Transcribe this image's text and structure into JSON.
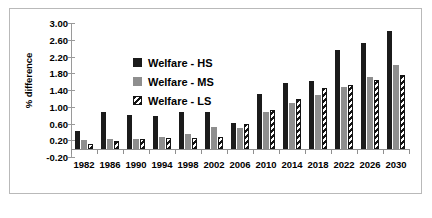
{
  "chart_data": {
    "type": "bar",
    "title": "",
    "subtitle": "",
    "xlabel": "",
    "ylabel": "% difference",
    "ylim": [
      -0.2,
      3.0
    ],
    "ytick_step": 0.4,
    "yticks": [
      "3.00",
      "2.60",
      "2.20",
      "1.80",
      "1.40",
      "1.00",
      "0.60",
      "0.20",
      "-0.20"
    ],
    "ytick_values": [
      3.0,
      2.6,
      2.2,
      1.8,
      1.4,
      1.0,
      0.6,
      0.2,
      -0.2
    ],
    "grid": false,
    "legend_position": "inside-upper-left",
    "categories": [
      "1982",
      "1986",
      "1990",
      "1994",
      "1998",
      "2002",
      "2006",
      "2010",
      "2014",
      "2018",
      "2022",
      "2026",
      "2030"
    ],
    "series": [
      {
        "name": "Welfare - HS",
        "color": "#1b1b1b",
        "pattern": "solid",
        "values": [
          0.42,
          0.87,
          0.81,
          0.79,
          0.87,
          0.87,
          0.62,
          1.31,
          1.56,
          1.62,
          2.35,
          2.52,
          2.8
        ]
      },
      {
        "name": "Welfare - MS",
        "color": "#8e8e8e",
        "pattern": "solid",
        "values": [
          0.21,
          0.22,
          0.24,
          0.27,
          0.36,
          0.52,
          0.5,
          0.87,
          1.08,
          1.28,
          1.48,
          1.72,
          2.0
        ]
      },
      {
        "name": "Welfare - LS",
        "color": "#141414",
        "pattern": "diagonal-hatch",
        "values": [
          0.12,
          0.19,
          0.22,
          0.25,
          0.25,
          0.28,
          0.58,
          0.92,
          1.18,
          1.44,
          1.52,
          1.63,
          1.75
        ]
      }
    ]
  },
  "legend": {
    "items": [
      {
        "label": "Welfare - HS",
        "swatch": "solid-black-swatch"
      },
      {
        "label": "Welfare - MS",
        "swatch": "solid-gray-swatch"
      },
      {
        "label": "Welfare - LS",
        "swatch": "hatched-swatch"
      }
    ]
  }
}
